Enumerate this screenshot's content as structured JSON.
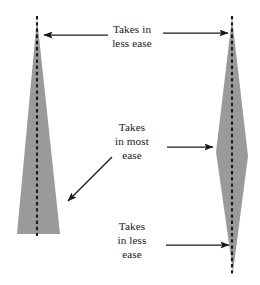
{
  "figure": {
    "background_color": "#ffffff",
    "shape_fill_color": "#9a9a9a",
    "centerline_color": "#1a1a1a",
    "arrow_color": "#1a1a1a",
    "text_color": "#1a1a1a"
  },
  "labels": {
    "top": "Takes in\nless ease",
    "middle": "Takes\nin most\nease",
    "bottom": "Takes\nin less\nease"
  },
  "shapes": {
    "left": {
      "name": "tall-triangle",
      "points": "37,18 60,234 17,234",
      "centerline": {
        "x": 37,
        "y1": 16,
        "y2": 236
      }
    },
    "right": {
      "name": "spindle",
      "points": "232,18 248,156 233,272 216,152",
      "centerline": {
        "x": 232,
        "y1": 16,
        "y2": 276
      }
    }
  },
  "arrows": [
    {
      "name": "arrow-top-left",
      "direction": "left",
      "x1": 108,
      "y1": 35,
      "x2": 44,
      "y2": 35
    },
    {
      "name": "arrow-middle-left-diagonal",
      "direction": "down-left",
      "x1": 112,
      "y1": 157,
      "x2": 68,
      "y2": 201
    },
    {
      "name": "arrow-top-right",
      "direction": "right",
      "x1": 163,
      "y1": 33,
      "x2": 228,
      "y2": 33
    },
    {
      "name": "arrow-middle-right",
      "direction": "right",
      "x1": 167,
      "y1": 147,
      "x2": 213,
      "y2": 147
    },
    {
      "name": "arrow-bottom-right",
      "direction": "right",
      "x1": 166,
      "y1": 245,
      "x2": 229,
      "y2": 245
    }
  ]
}
